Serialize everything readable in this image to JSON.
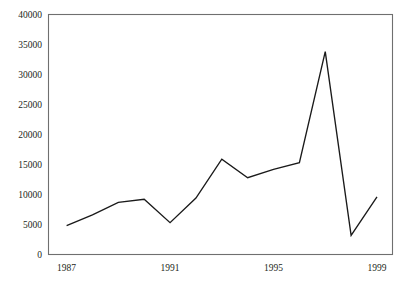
{
  "chart_data": {
    "type": "line",
    "title": "",
    "subtitle": "",
    "xlabel": "",
    "ylabel": "",
    "x": [
      1987,
      1988,
      1989,
      1990,
      1991,
      1992,
      1993,
      1994,
      1995,
      1996,
      1997,
      1998,
      1999
    ],
    "values": [
      4800,
      6600,
      8700,
      9200,
      5300,
      9400,
      15900,
      12800,
      14200,
      15300,
      33800,
      3200,
      9600
    ],
    "series": [
      {
        "name": "series-1",
        "values": [
          4800,
          6600,
          8700,
          9200,
          5300,
          9400,
          15900,
          12800,
          14200,
          15300,
          33800,
          3200,
          9600
        ]
      }
    ],
    "xlim": [
      1986.3,
      1999.6
    ],
    "ylim": [
      0,
      40000
    ],
    "xticks": [
      1987,
      1991,
      1995,
      1999
    ],
    "xtick_labels": [
      "1987",
      "1991",
      "1995",
      "1999"
    ],
    "yticks": [
      0,
      5000,
      10000,
      15000,
      20000,
      25000,
      30000,
      35000,
      40000
    ],
    "ytick_labels": [
      "0",
      "5000",
      "10000",
      "15000",
      "20000",
      "25000",
      "30000",
      "35000",
      "40000"
    ],
    "grid": false,
    "legend": false,
    "legend_position": "none",
    "line_color": "#1a1a1a",
    "frame_color": "#6f6f6f",
    "background_color": "#ffffff"
  }
}
